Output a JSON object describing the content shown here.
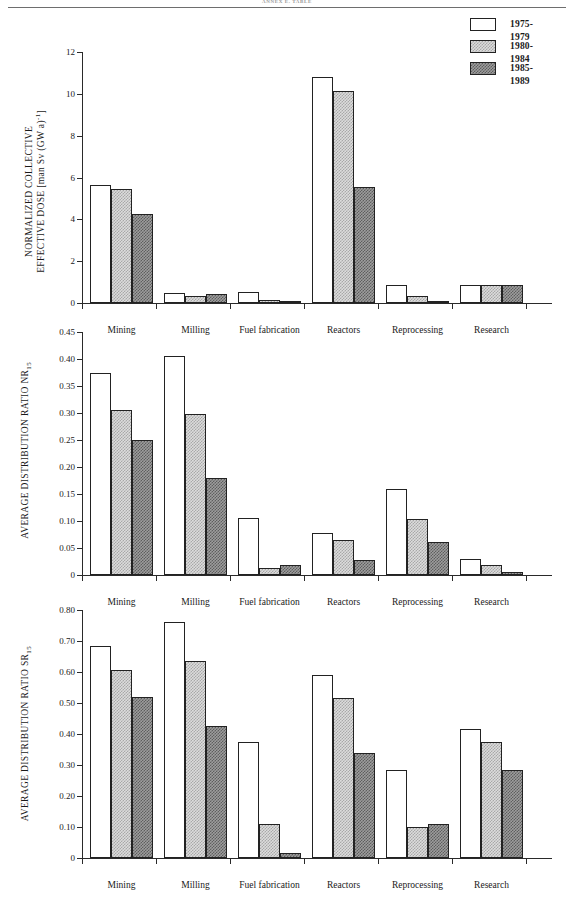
{
  "page": {
    "header": "ANNEX E. TABLE"
  },
  "legend": {
    "items": [
      {
        "label": "1975-1979",
        "pattern": "white"
      },
      {
        "label": "1980-1984",
        "pattern": "light-stipple"
      },
      {
        "label": "1985-1989",
        "pattern": "dark-stipple"
      }
    ]
  },
  "categories": [
    "Mining",
    "Milling",
    "Fuel  fabrication",
    "Reactors",
    "Reprocessing",
    "Research"
  ],
  "chart_data": [
    {
      "type": "bar",
      "title": "",
      "ylabel_line1": "NORMALIZED COLLECTIVE",
      "ylabel_line2": "EFFECTIVE DOSE [man Sv (GW a)",
      "ylabel_exp": "-1",
      "ylabel_tail": "]",
      "xlabel": "",
      "categories": [
        "Mining",
        "Milling",
        "Fuel  fabrication",
        "Reactors",
        "Reprocessing",
        "Research"
      ],
      "ylim": [
        0,
        12
      ],
      "yticks": [
        0,
        2,
        4,
        6,
        8,
        10,
        12
      ],
      "yticklabels": [
        "0",
        "2",
        "4",
        "6",
        "8",
        "10",
        "12"
      ],
      "grid": false,
      "legend_position": "top-right",
      "series": [
        {
          "name": "1975-1979",
          "values": [
            5.65,
            0.48,
            0.55,
            10.8,
            0.85,
            0.85
          ]
        },
        {
          "name": "1980-1984",
          "values": [
            5.45,
            0.35,
            0.16,
            10.15,
            0.35,
            0.85
          ]
        },
        {
          "name": "1985-1989",
          "values": [
            4.25,
            0.42,
            0.08,
            5.55,
            0.12,
            0.85
          ]
        }
      ]
    },
    {
      "type": "bar",
      "title": "",
      "ylabel_line1": "AVERAGE DISTRIBUTION RATIO NR",
      "ylabel_sub": "15",
      "xlabel": "",
      "categories": [
        "Mining",
        "Milling",
        "Fuel  fabrication",
        "Reactors",
        "Reprocessing",
        "Research"
      ],
      "ylim": [
        0,
        0.45
      ],
      "yticks": [
        0,
        0.05,
        0.1,
        0.15,
        0.2,
        0.25,
        0.3,
        0.35,
        0.4,
        0.45
      ],
      "yticklabels": [
        "0",
        "0.05",
        "0.10",
        "0.15",
        "0.20",
        "0.25",
        "0.30",
        "0.35",
        "0.40",
        "0.45"
      ],
      "grid": false,
      "series": [
        {
          "name": "1975-1979",
          "values": [
            0.375,
            0.405,
            0.105,
            0.078,
            0.16,
            0.03
          ]
        },
        {
          "name": "1980-1984",
          "values": [
            0.305,
            0.298,
            0.013,
            0.065,
            0.103,
            0.018
          ]
        },
        {
          "name": "1985-1989",
          "values": [
            0.25,
            0.18,
            0.018,
            0.028,
            0.062,
            0.006
          ]
        }
      ]
    },
    {
      "type": "bar",
      "title": "",
      "ylabel_line1": "AVERAGE DISTRIBUTION RATIO SR",
      "ylabel_sub": "15",
      "xlabel": "",
      "categories": [
        "Mining",
        "Milling",
        "Fuel  fabrication",
        "Reactors",
        "Reprocessing",
        "Research"
      ],
      "ylim": [
        0,
        0.8
      ],
      "yticks": [
        0,
        0.1,
        0.2,
        0.3,
        0.4,
        0.5,
        0.6,
        0.7,
        0.8
      ],
      "yticklabels": [
        "0",
        "0.10",
        "0.20",
        "0.30",
        "0.40",
        "0.50",
        "0.60",
        "0.70",
        "0.80"
      ],
      "grid": false,
      "series": [
        {
          "name": "1975-1979",
          "values": [
            0.685,
            0.76,
            0.375,
            0.59,
            0.285,
            0.415
          ]
        },
        {
          "name": "1980-1984",
          "values": [
            0.605,
            0.635,
            0.11,
            0.515,
            0.1,
            0.375
          ]
        },
        {
          "name": "1985-1989",
          "values": [
            0.52,
            0.425,
            0.015,
            0.34,
            0.11,
            0.285
          ]
        }
      ]
    }
  ]
}
